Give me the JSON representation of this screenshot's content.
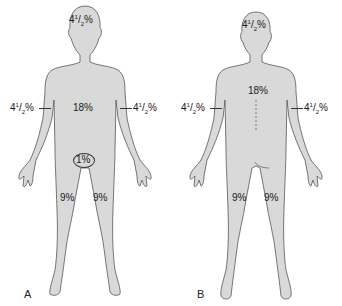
{
  "colors": {
    "skin_fill": "#d9d9d9",
    "outline": "#555555",
    "text": "#1a1a1a",
    "background": "#ffffff"
  },
  "figures": [
    {
      "panel": "A",
      "view": "anterior",
      "labels": {
        "head": {
          "whole": "4",
          "num": "1",
          "den": "2",
          "suffix": "%"
        },
        "trunk": "18%",
        "right_arm": {
          "whole": "4",
          "num": "1",
          "den": "2",
          "suffix": "%"
        },
        "left_arm": {
          "whole": "4",
          "num": "1",
          "den": "2",
          "suffix": "%"
        },
        "genitalia": "1%",
        "right_leg": "9%",
        "left_leg": "9%"
      }
    },
    {
      "panel": "B",
      "view": "posterior",
      "labels": {
        "head": {
          "whole": "4",
          "num": "1",
          "den": "2",
          "suffix": "%"
        },
        "trunk": "18%",
        "right_arm": {
          "whole": "4",
          "num": "1",
          "den": "2",
          "suffix": "%"
        },
        "left_arm": {
          "whole": "4",
          "num": "1",
          "den": "2",
          "suffix": "%"
        },
        "right_leg": "9%",
        "left_leg": "9%"
      }
    }
  ]
}
